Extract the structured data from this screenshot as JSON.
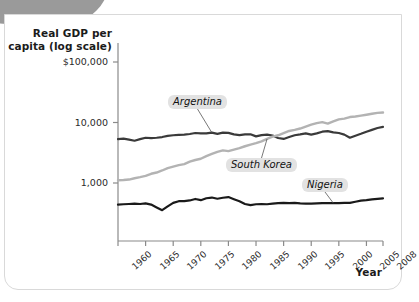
{
  "figure": {
    "y_axis_title": "Real GDP per capita (log scale)",
    "x_axis_title": "Year"
  },
  "chart_data": {
    "type": "line",
    "title": "",
    "subtitle": "",
    "xlabel": "Year",
    "ylabel": "Real GDP per capita (log scale)",
    "yscale": "log",
    "ylim": [
      200,
      100000
    ],
    "xlim": [
      1960,
      2008
    ],
    "grid": false,
    "legend": "inline-annotations",
    "ytick_labels": [
      "$100,000",
      "10,000",
      "1,000"
    ],
    "ytick_values": [
      100000,
      10000,
      1000
    ],
    "xtick_labels": [
      "1960",
      "1965",
      "1970",
      "1975",
      "1980",
      "1985",
      "1990",
      "1995",
      "2000",
      "2005",
      "2008"
    ],
    "xtick_values": [
      1960,
      1965,
      1970,
      1975,
      1980,
      1985,
      1990,
      1995,
      2000,
      2005,
      2008
    ],
    "x": [
      1960,
      1961,
      1962,
      1963,
      1964,
      1965,
      1966,
      1967,
      1968,
      1969,
      1970,
      1971,
      1972,
      1973,
      1974,
      1975,
      1976,
      1977,
      1978,
      1979,
      1980,
      1981,
      1982,
      1983,
      1984,
      1985,
      1986,
      1987,
      1988,
      1989,
      1990,
      1991,
      1992,
      1993,
      1994,
      1995,
      1996,
      1997,
      1998,
      1999,
      2000,
      2001,
      2002,
      2003,
      2004,
      2005,
      2006,
      2007,
      2008
    ],
    "series": [
      {
        "name": "Argentina",
        "color": "#3a3a3a",
        "values": [
          5300,
          5400,
          5200,
          5000,
          5300,
          5600,
          5500,
          5600,
          5750,
          6000,
          6150,
          6250,
          6300,
          6450,
          6700,
          6600,
          6600,
          6800,
          6500,
          6800,
          6750,
          6350,
          6200,
          6350,
          6400,
          5900,
          6200,
          6300,
          6100,
          5550,
          5350,
          5750,
          6150,
          6350,
          6600,
          6300,
          6600,
          7050,
          7200,
          6850,
          6700,
          6300,
          5600,
          6050,
          6500,
          7050,
          7550,
          8100,
          8450
        ]
      },
      {
        "name": "South Korea",
        "color": "#b3b3b3",
        "values": [
          1110,
          1120,
          1140,
          1200,
          1250,
          1310,
          1420,
          1490,
          1610,
          1760,
          1870,
          1970,
          2050,
          2250,
          2400,
          2520,
          2780,
          3020,
          3260,
          3460,
          3360,
          3550,
          3760,
          4050,
          4320,
          4550,
          4880,
          5350,
          5840,
          6150,
          6680,
          7240,
          7550,
          7950,
          8550,
          9200,
          9750,
          10150,
          9580,
          10450,
          11250,
          11600,
          12300,
          12550,
          13000,
          13450,
          13950,
          14450,
          14600
        ]
      },
      {
        "name": "Nigeria",
        "color": "#1a1a1a",
        "values": [
          440,
          445,
          450,
          455,
          450,
          460,
          440,
          395,
          355,
          410,
          470,
          500,
          500,
          515,
          545,
          520,
          560,
          575,
          550,
          570,
          585,
          540,
          500,
          450,
          430,
          445,
          450,
          445,
          455,
          465,
          470,
          465,
          470,
          460,
          455,
          455,
          460,
          465,
          465,
          465,
          465,
          470,
          470,
          490,
          510,
          520,
          535,
          545,
          555
        ]
      }
    ],
    "annotations": [
      {
        "text": "Argentina",
        "series": "Argentina",
        "anchor_year": 1977
      },
      {
        "text": "South Korea",
        "series": "South Korea",
        "anchor_year": 1987
      },
      {
        "text": "Nigeria",
        "series": "Nigeria",
        "anchor_year": 1999
      }
    ]
  }
}
